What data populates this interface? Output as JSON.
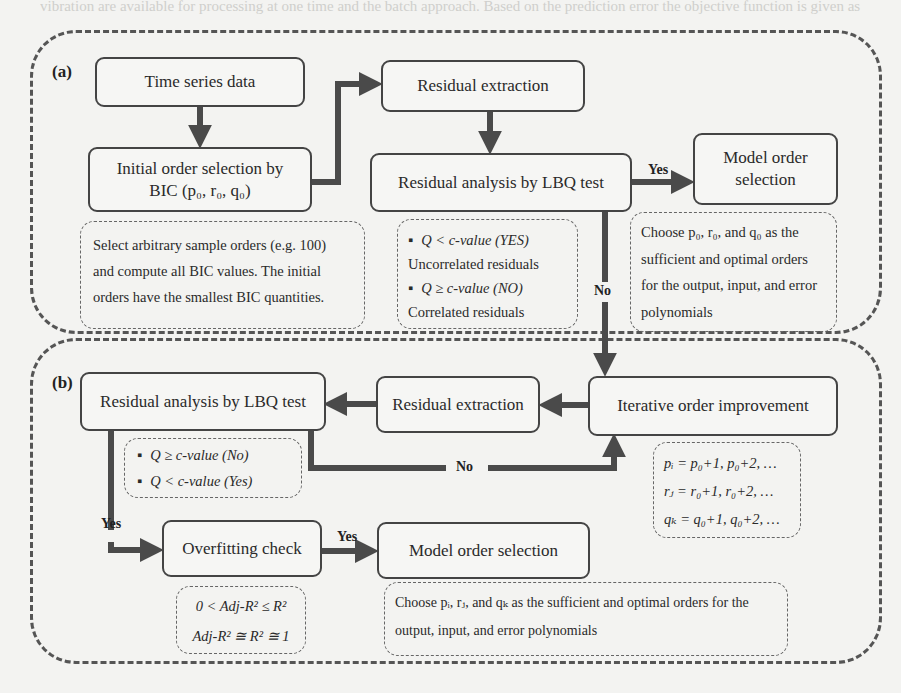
{
  "background_text": "vibration are available for processing at one time and the batch approach. Based on the prediction error the objective function is given as",
  "panel_a": {
    "label": "(a)",
    "time_series_box": "Time series data",
    "initial_order_box": {
      "line1": "Initial order selection by",
      "line2": "BIC (p₀, r₀, q₀)"
    },
    "initial_order_note": [
      "Select arbitrary sample orders (e.g. 100)",
      "and compute all BIC values. The initial",
      "orders have the smallest BIC quantities."
    ],
    "residual_extraction_box": "Residual extraction",
    "residual_analysis_box": "Residual analysis by LBQ test",
    "lbq_note": {
      "item1": "Q < c-value (YES)",
      "item1_desc": "Uncorrelated residuals",
      "item2": "Q ≥ c-value (NO)",
      "item2_desc": "Correlated residuals"
    },
    "yes_label": "Yes",
    "no_label": "No",
    "model_order_box": {
      "line1": "Model order",
      "line2": "selection"
    },
    "model_order_note": [
      "Choose p₀, r₀, and q₀ as the",
      "sufficient and optimal orders",
      "for the output, input, and error",
      "polynomials"
    ]
  },
  "panel_b": {
    "label": "(b)",
    "residual_analysis_box": "Residual analysis by LBQ test",
    "lbq_note": {
      "item1": "Q ≥ c-value (No)",
      "item2": "Q < c-value (Yes)"
    },
    "residual_extraction_box": "Residual extraction",
    "iterative_box": "Iterative order improvement",
    "iterative_note": [
      "pᵢ = p₀+1, p₀+2, …",
      "rⱼ = r₀+1, r₀+2, …",
      "qₖ = q₀+1, q₀+2, …"
    ],
    "no_label": "No",
    "yes_label_down": "Yes",
    "yes_label_right": "Yes",
    "overfitting_box": "Overfitting check",
    "overfitting_note": [
      "0 < Adj-R² ≤ R²",
      "Adj-R² ≅ R² ≅ 1"
    ],
    "model_order_box": "Model order selection",
    "model_order_note": [
      "Choose pᵢ, rⱼ, and qₖ as the sufficient and optimal orders for the",
      "output, input, and error polynomials"
    ]
  },
  "colors": {
    "arrow": "#4a4a4a",
    "border": "#444444",
    "background": "#f3f3f1"
  }
}
